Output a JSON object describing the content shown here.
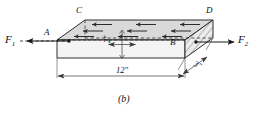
{
  "figure": {
    "caption": "(b)",
    "type": "engineering-diagram"
  },
  "labels": {
    "force_left": {
      "symbol": "F",
      "subscript": "1",
      "text": "F1"
    },
    "force_right": {
      "symbol": "F",
      "subscript": "2",
      "text": "F2"
    },
    "corner_a": "A",
    "corner_b": "B",
    "corner_c": "C",
    "corner_d": "D"
  },
  "dimensions": {
    "length": "12\"",
    "thickness": "2\"",
    "width": "3\""
  },
  "colors": {
    "line": "#1a1a1a",
    "top_face": "#d8d8d8",
    "front_face": "#f2f2f2",
    "end_face": "#e4e4e4",
    "hatch": "#555555",
    "dimension_line": "#444444"
  },
  "shear_arrows": {
    "direction": "left",
    "rows": 3,
    "per_row": 3,
    "count": 9
  }
}
